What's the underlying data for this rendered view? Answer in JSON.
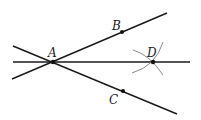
{
  "diagram": {
    "points": {
      "A": {
        "label": "A",
        "x": 53,
        "y": 62
      },
      "B": {
        "label": "B",
        "x": 122,
        "y": 32
      },
      "C": {
        "label": "C",
        "x": 123,
        "y": 91
      },
      "D": {
        "label": "D",
        "x": 153,
        "y": 62
      }
    },
    "colors": {
      "line": "#1a1a1a",
      "arc": "#8a8a8a",
      "background": "#ffffff"
    }
  }
}
